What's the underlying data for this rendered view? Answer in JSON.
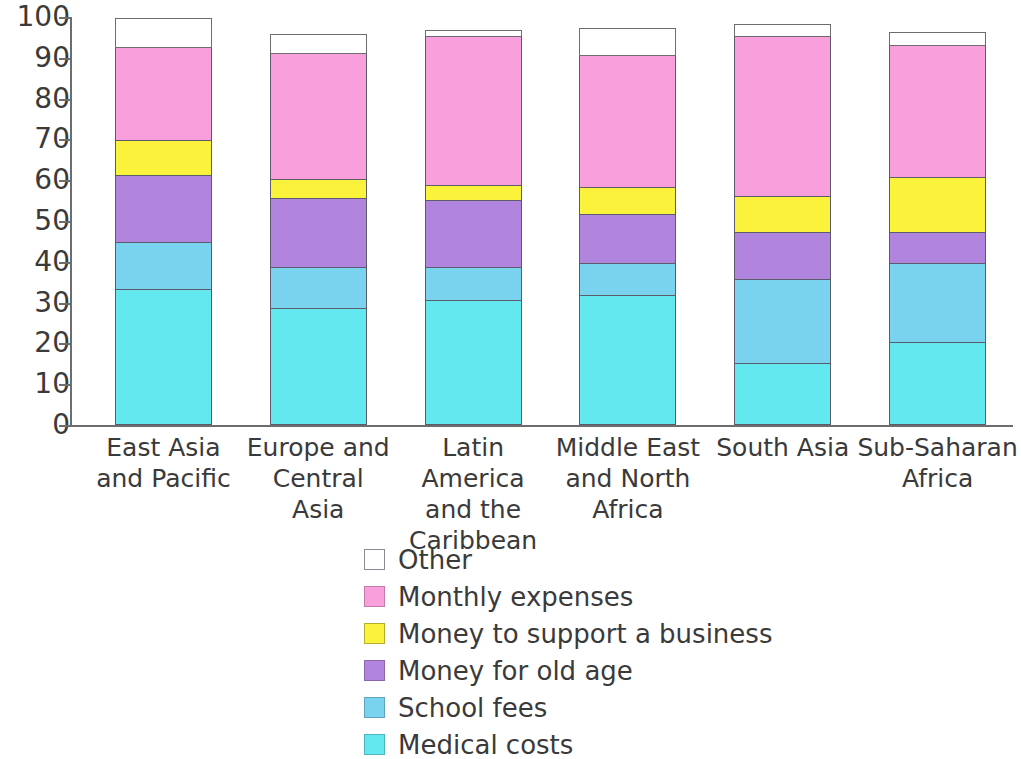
{
  "chart_data": {
    "type": "bar",
    "subtype": "stacked-bar-100",
    "title": "",
    "xlabel": "",
    "ylabel": "",
    "ylim": [
      0,
      100
    ],
    "yticks": [
      0,
      10,
      20,
      30,
      40,
      50,
      60,
      70,
      80,
      90,
      100
    ],
    "ytick_labels": [
      "0",
      "10",
      "20",
      "30",
      "40",
      "50",
      "60",
      "70",
      "80",
      "90",
      "100"
    ],
    "grid": false,
    "legend_position": "bottom-center",
    "categories": [
      "East Asia and Pacific",
      "Europe and Central Asia",
      "Latin America and the Caribbean",
      "Middle East and North Africa",
      "South Asia",
      "Sub-Saharan Africa"
    ],
    "category_label_lines": [
      [
        "East Asia",
        "and Pacific"
      ],
      [
        "Europe and",
        "Central",
        "Asia"
      ],
      [
        "Latin America",
        "and the",
        "Caribbean"
      ],
      [
        "Middle East",
        "and North",
        "Africa"
      ],
      [
        "South Asia"
      ],
      [
        "Sub-Saharan",
        "Africa"
      ]
    ],
    "series": [
      {
        "name": "Medical costs",
        "color": "#64e8f0",
        "values": [
          33,
          28.5,
          30.5,
          31.5,
          15,
          20
        ]
      },
      {
        "name": "School fees",
        "color": "#79d2ee",
        "values": [
          11.5,
          10,
          8,
          8,
          20.5,
          19.5
        ]
      },
      {
        "name": "Money for old age",
        "color": "#b184dd",
        "values": [
          16.5,
          17,
          16.5,
          12,
          11.5,
          7.5
        ]
      },
      {
        "name": "Money to support a business",
        "color": "#fbf23c",
        "values": [
          8.5,
          4.5,
          3.5,
          6.5,
          9,
          13.5
        ]
      },
      {
        "name": "Monthly expenses",
        "color": "#f9a0dc",
        "values": [
          23,
          31,
          36.5,
          32.5,
          39,
          32.5
        ]
      },
      {
        "name": "Other",
        "color": "#ffffff",
        "values": [
          7,
          4.5,
          1.5,
          6.5,
          3,
          3
        ]
      }
    ],
    "cumulative_tops": [
      [
        33,
        44.5,
        61,
        69.5,
        92.5,
        99.5
      ],
      [
        28.5,
        38.5,
        55.5,
        60,
        91,
        95.5
      ],
      [
        30.5,
        38.5,
        55,
        58.5,
        95,
        96.5
      ],
      [
        31.5,
        39.5,
        51.5,
        58,
        90.5,
        97
      ],
      [
        15,
        35.5,
        47,
        56,
        95,
        98
      ],
      [
        20,
        39.5,
        47,
        60.5,
        93,
        96
      ]
    ],
    "bar_totals": [
      99.5,
      95.5,
      96.5,
      97,
      98,
      96
    ]
  },
  "legend": {
    "items": [
      {
        "label": "Other",
        "color": "#ffffff",
        "border": "#8a8a95"
      },
      {
        "label": "Monthly expenses",
        "color": "#f9a0dc",
        "border": "#c47aab"
      },
      {
        "label": "Money to support a business",
        "color": "#fbf23c",
        "border": "#b5ae2d"
      },
      {
        "label": "Money for old age",
        "color": "#b184dd",
        "border": "#8a66ad"
      },
      {
        "label": "School fees",
        "color": "#79d2ee",
        "border": "#5fa6bc"
      },
      {
        "label": "Medical costs",
        "color": "#64e8f0",
        "border": "#50b6bd"
      }
    ]
  }
}
